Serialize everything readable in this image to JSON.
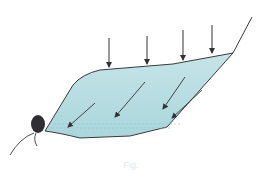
{
  "diagram": {
    "colors": {
      "water_fill": "#b5dde2",
      "water_fill_light": "#cfe9ec",
      "outline": "#3a3a3a",
      "arrow": "#333333",
      "outlet": "#2f2f33",
      "dashed_lines": "#9cc8ce"
    },
    "vertical_arrows": [
      {
        "x": 109,
        "y1": 38,
        "y2": 67
      },
      {
        "x": 147,
        "y1": 36,
        "y2": 64
      },
      {
        "x": 183,
        "y1": 30,
        "y2": 60
      },
      {
        "x": 212,
        "y1": 25,
        "y2": 53
      }
    ],
    "diagonal_arrows": [
      {
        "x1": 95,
        "y1": 103,
        "x2": 68,
        "y2": 127
      },
      {
        "x1": 145,
        "y1": 82,
        "x2": 115,
        "y2": 117
      },
      {
        "x1": 185,
        "y1": 77,
        "x2": 163,
        "y2": 109
      },
      {
        "x1": 202,
        "y1": 90,
        "x2": 172,
        "y2": 118
      }
    ],
    "outlet_label": "outlet",
    "caption": "Fig."
  }
}
